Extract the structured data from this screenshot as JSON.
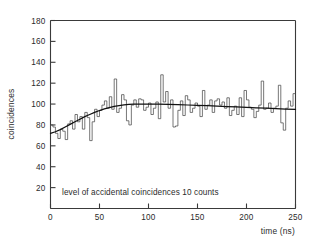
{
  "figure": {
    "background_color": "#ffffff",
    "line_color": "#3a3a3a",
    "histogram_color": "#4a4a4a",
    "fit_color": "#111111"
  },
  "annotation_text": "level of accidental coincidences 10 counts",
  "chart_data": {
    "type": "line",
    "title": "",
    "xlabel": "time (ns)",
    "ylabel": "coincidences",
    "xlim": [
      0,
      250
    ],
    "ylim": [
      0,
      180
    ],
    "xticks": [
      0,
      50,
      100,
      150,
      200,
      250
    ],
    "yticks": [
      20,
      40,
      60,
      80,
      100,
      120,
      140,
      160,
      180
    ],
    "xtick_labels": [
      "0",
      "50",
      "100",
      "150",
      "200",
      "250"
    ],
    "ytick_labels": [
      "20",
      "40",
      "60",
      "80",
      "100",
      "120",
      "140",
      "160",
      "180"
    ],
    "grid": false,
    "legend": false,
    "annotations": [
      {
        "text": "level of accidental coincidences 10 counts",
        "x": 12,
        "y": 22
      }
    ],
    "series": [
      {
        "name": "coincidences",
        "type": "step-histogram",
        "bin_width": 2.5,
        "x": [
          1.25,
          3.75,
          6.25,
          8.75,
          11.25,
          13.75,
          16.25,
          18.75,
          21.25,
          23.75,
          26.25,
          28.75,
          31.25,
          33.75,
          36.25,
          38.75,
          41.25,
          43.75,
          46.25,
          48.75,
          51.25,
          53.75,
          56.25,
          58.75,
          61.25,
          63.75,
          66.25,
          68.75,
          71.25,
          73.75,
          76.25,
          78.75,
          81.25,
          83.75,
          86.25,
          88.75,
          91.25,
          93.75,
          96.25,
          98.75,
          101.25,
          103.75,
          106.25,
          108.75,
          111.25,
          113.75,
          116.25,
          118.75,
          121.25,
          123.75,
          126.25,
          128.75,
          131.25,
          133.75,
          136.25,
          138.75,
          141.25,
          143.75,
          146.25,
          148.75,
          151.25,
          153.75,
          156.25,
          158.75,
          161.25,
          163.75,
          166.25,
          168.75,
          171.25,
          173.75,
          176.25,
          178.75,
          181.25,
          183.75,
          186.25,
          188.75,
          191.25,
          193.75,
          196.25,
          198.75,
          201.25,
          203.75,
          206.25,
          208.75,
          211.25,
          213.75,
          216.25,
          218.75,
          221.25,
          223.75,
          226.25,
          228.75,
          231.25,
          233.75,
          236.25,
          238.75,
          241.25,
          243.75,
          246.25,
          248.75
        ],
        "values": [
          80,
          78,
          72,
          67,
          76,
          74,
          66,
          81,
          84,
          76,
          90,
          83,
          88,
          76,
          92,
          87,
          65,
          83,
          95,
          88,
          94,
          99,
          103,
          96,
          107,
          95,
          124,
          92,
          96,
          109,
          104,
          84,
          80,
          99,
          104,
          97,
          105,
          104,
          94,
          97,
          101,
          90,
          96,
          102,
          86,
          128,
          102,
          112,
          96,
          104,
          78,
          79,
          94,
          103,
          89,
          108,
          104,
          92,
          96,
          101,
          98,
          88,
          113,
          95,
          99,
          104,
          92,
          103,
          105,
          99,
          102,
          96,
          106,
          89,
          94,
          98,
          90,
          106,
          88,
          113,
          104,
          97,
          95,
          87,
          93,
          99,
          122,
          95,
          96,
          101,
          92,
          96,
          98,
          118,
          82,
          75,
          96,
          103,
          98,
          110
        ]
      },
      {
        "name": "fitted curve",
        "type": "line",
        "x": [
          0,
          5,
          10,
          15,
          20,
          25,
          30,
          35,
          40,
          45,
          50,
          55,
          60,
          65,
          70,
          75,
          80,
          85,
          90,
          95,
          100,
          110,
          120,
          130,
          140,
          150,
          160,
          170,
          180,
          190,
          200,
          210,
          220,
          230,
          240,
          250
        ],
        "values": [
          72,
          73.5,
          75.5,
          78,
          80.5,
          83,
          85.5,
          88,
          90,
          92,
          93.8,
          95.3,
          96.6,
          97.7,
          98.5,
          99.2,
          99.6,
          99.9,
          100,
          100,
          100,
          99.9,
          99.7,
          99.4,
          99.1,
          98.8,
          98.4,
          98.0,
          97.6,
          97.2,
          96.8,
          96.4,
          96.0,
          95.6,
          95.2,
          94.8
        ]
      }
    ]
  }
}
